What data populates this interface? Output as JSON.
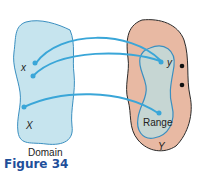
{
  "figure": {
    "caption": "Figure 34",
    "domain_label": "Domain",
    "domain_set": "X",
    "domain_element": "x",
    "codomain_set": "Y",
    "codomain_element": "y",
    "range_label": "Range",
    "colors": {
      "domain_fill": "#c6e4ee",
      "codomain_fill": "#e8b9a3",
      "range_fill": "#c6d6d3",
      "arrow": "#3aa6d8",
      "outline": "#3a8fc0",
      "caption": "#1f4f9a"
    }
  }
}
